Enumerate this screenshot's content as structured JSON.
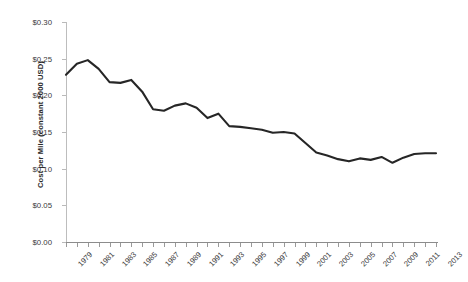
{
  "chart_data": {
    "type": "line",
    "title": "",
    "xlabel": "",
    "ylabel": "Cost per Mile (constant 2000 USD)",
    "ylim": [
      0.0,
      0.3
    ],
    "xlim": [
      1979,
      2013
    ],
    "y_tick_labels": [
      "$0.30",
      "$0.25",
      "$0.20",
      "$0.15",
      "$0.10",
      "$0.05",
      "$0.00"
    ],
    "y_tick_values": [
      0.3,
      0.25,
      0.2,
      0.15,
      0.1,
      0.05,
      0.0
    ],
    "x_tick_labels": [
      "1979",
      "1981",
      "1983",
      "1985",
      "1987",
      "1989",
      "1991",
      "1993",
      "1995",
      "1997",
      "1999",
      "2001",
      "2003",
      "2005",
      "2007",
      "2009",
      "2011",
      "2013"
    ],
    "grid": false,
    "legend": "none",
    "line_color": "#262626",
    "axis_color": "#b9b9b9",
    "background_color": "#ffffff",
    "categories": [
      1979,
      1980,
      1981,
      1982,
      1983,
      1984,
      1985,
      1986,
      1987,
      1988,
      1989,
      1990,
      1991,
      1992,
      1993,
      1994,
      1995,
      1996,
      1997,
      1998,
      1999,
      2000,
      2001,
      2002,
      2003,
      2004,
      2005,
      2006,
      2007,
      2008,
      2009,
      2010,
      2011,
      2012,
      2013
    ],
    "values": [
      0.228,
      0.243,
      0.248,
      0.236,
      0.218,
      0.217,
      0.221,
      0.205,
      0.181,
      0.179,
      0.186,
      0.189,
      0.183,
      0.169,
      0.175,
      0.158,
      0.157,
      0.155,
      0.153,
      0.149,
      0.15,
      0.148,
      0.135,
      0.122,
      0.118,
      0.113,
      0.11,
      0.114,
      0.112,
      0.116,
      0.108,
      0.115,
      0.12,
      0.121,
      0.121
    ],
    "series": [
      {
        "name": "Cost per Mile",
        "values": [
          0.228,
          0.243,
          0.248,
          0.236,
          0.218,
          0.217,
          0.221,
          0.205,
          0.181,
          0.179,
          0.186,
          0.189,
          0.183,
          0.169,
          0.175,
          0.158,
          0.157,
          0.155,
          0.153,
          0.149,
          0.15,
          0.148,
          0.135,
          0.122,
          0.118,
          0.113,
          0.11,
          0.114,
          0.112,
          0.116,
          0.108,
          0.115,
          0.12,
          0.121,
          0.121
        ]
      }
    ]
  }
}
